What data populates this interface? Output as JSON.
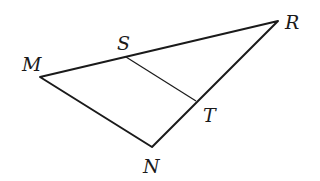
{
  "diagram": {
    "type": "triangle",
    "points": {
      "M": {
        "x": 40,
        "y": 77,
        "label": "M",
        "label_x": 22,
        "label_y": 71
      },
      "R": {
        "x": 278,
        "y": 21,
        "label": "R",
        "label_x": 285,
        "label_y": 29
      },
      "N": {
        "x": 152,
        "y": 147,
        "label": "N",
        "label_x": 143,
        "label_y": 173
      },
      "S": {
        "x": 126,
        "y": 57,
        "label": "S",
        "label_x": 117,
        "label_y": 50
      },
      "T": {
        "x": 196,
        "y": 101,
        "label": "T",
        "label_x": 203,
        "label_y": 122
      }
    },
    "edges": [
      {
        "from": "M",
        "to": "R",
        "name": "side-MR"
      },
      {
        "from": "R",
        "to": "N",
        "name": "side-RN"
      },
      {
        "from": "N",
        "to": "M",
        "name": "side-NM"
      }
    ],
    "segments": [
      {
        "from": "S",
        "to": "T",
        "name": "segment-ST"
      }
    ],
    "labels": [
      "M",
      "S",
      "R",
      "T",
      "N"
    ],
    "stroke_color": "#1a1a1a"
  }
}
